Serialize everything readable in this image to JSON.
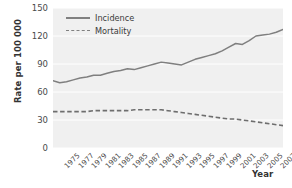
{
  "chart_data": {
    "type": "line",
    "title": "",
    "xlabel": "Year",
    "ylabel": "Rate per 100 000",
    "xlim": [
      1975,
      2009
    ],
    "ylim": [
      0,
      150
    ],
    "yticks": [
      0,
      30,
      60,
      90,
      120,
      150
    ],
    "grid": true,
    "legend_position": "top-left",
    "x": [
      1975,
      1976,
      1977,
      1978,
      1979,
      1980,
      1981,
      1982,
      1983,
      1984,
      1985,
      1986,
      1987,
      1988,
      1989,
      1990,
      1991,
      1992,
      1993,
      1994,
      1995,
      1996,
      1997,
      1998,
      1999,
      2000,
      2001,
      2002,
      2003,
      2004,
      2005,
      2006,
      2007,
      2008,
      2009
    ],
    "xtick_labels": [
      "1975",
      "1977",
      "1979",
      "1981",
      "1983",
      "1985",
      "1987",
      "1989",
      "1991",
      "1993",
      "1995",
      "1997",
      "1999",
      "2001",
      "2003",
      "2005",
      "2007",
      "2009"
    ],
    "series": [
      {
        "name": "Incidence",
        "style": "solid",
        "color": "#7f7f7f",
        "values": [
          72,
          70,
          71,
          73,
          75,
          76,
          78,
          78,
          80,
          82,
          83,
          85,
          84,
          86,
          88,
          90,
          92,
          91,
          90,
          89,
          92,
          95,
          97,
          99,
          101,
          104,
          108,
          112,
          111,
          115,
          120,
          121,
          122,
          124,
          127
        ]
      },
      {
        "name": "Mortality",
        "style": "dashed",
        "color": "#7f7f7f",
        "values": [
          39,
          39,
          39,
          39,
          39,
          39,
          40,
          40,
          40,
          40,
          40,
          40,
          41,
          41,
          41,
          41,
          41,
          40,
          39,
          38,
          37,
          36,
          35,
          34,
          33,
          32,
          31,
          31,
          30,
          29,
          28,
          27,
          26,
          25,
          24
        ]
      }
    ]
  },
  "legend": {
    "items": [
      {
        "label": "Incidence",
        "style": "solid"
      },
      {
        "label": "Mortality",
        "style": "dashed"
      }
    ]
  },
  "axes": {
    "y_title": "Rate per 100 000",
    "x_title": "Year"
  }
}
